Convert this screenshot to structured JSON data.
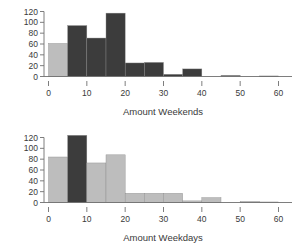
{
  "figure": {
    "background": "#ffffff",
    "axis_color": "#6f6f6f",
    "text_color": "#3a3a3a",
    "dark_bar_color": "#3c3c3c",
    "light_bar_color": "#bdbdbd"
  },
  "chart_data": [
    {
      "type": "bar",
      "title": "",
      "xlabel": "Amount Weekends",
      "ylabel": "",
      "xlim": [
        0,
        62
      ],
      "ylim": [
        0,
        125
      ],
      "xticks": [
        0,
        10,
        20,
        30,
        40,
        50,
        60
      ],
      "xticklabels": [
        "0",
        "10",
        "20",
        "30",
        "40",
        "50",
        "60"
      ],
      "yticks": [
        0,
        20,
        40,
        60,
        80,
        100,
        120
      ],
      "yticklabels": [
        "0",
        "20",
        "40",
        "60",
        "80",
        "100",
        "120"
      ],
      "grid": false,
      "legend": "none",
      "bin_width": 5,
      "bin_edges": [
        0,
        5,
        10,
        15,
        20,
        25,
        30,
        35,
        40,
        45,
        50,
        55,
        60
      ],
      "categories": [
        "0-5",
        "5-10",
        "10-15",
        "15-20",
        "20-25",
        "25-30",
        "30-35",
        "35-40",
        "40-45",
        "45-50",
        "50-55",
        "55-60"
      ],
      "values": [
        61,
        94,
        71,
        117,
        25,
        26,
        4,
        14,
        0,
        2,
        0,
        1
      ],
      "bar_colors": [
        "#bdbdbd",
        "#3c3c3c",
        "#3c3c3c",
        "#3c3c3c",
        "#3c3c3c",
        "#3c3c3c",
        "#3c3c3c",
        "#3c3c3c",
        "#3c3c3c",
        "#3c3c3c",
        "#3c3c3c",
        "#3c3c3c"
      ]
    },
    {
      "type": "bar",
      "title": "",
      "xlabel": "Amount Weekdays",
      "ylabel": "",
      "xlim": [
        0,
        62
      ],
      "ylim": [
        0,
        125
      ],
      "xticks": [
        0,
        10,
        20,
        30,
        40,
        50,
        60
      ],
      "xticklabels": [
        "0",
        "10",
        "20",
        "30",
        "40",
        "50",
        "60"
      ],
      "yticks": [
        0,
        20,
        40,
        60,
        80,
        100,
        120
      ],
      "yticklabels": [
        "0",
        "20",
        "40",
        "60",
        "80",
        "100",
        "120"
      ],
      "grid": false,
      "legend": "none",
      "bin_width": 5,
      "bin_edges": [
        0,
        5,
        10,
        15,
        20,
        25,
        30,
        35,
        40,
        45,
        50,
        55,
        60
      ],
      "categories": [
        "0-5",
        "5-10",
        "10-15",
        "15-20",
        "20-25",
        "25-30",
        "30-35",
        "35-40",
        "40-45",
        "45-50",
        "50-55",
        "55-60"
      ],
      "values": [
        84,
        124,
        73,
        88,
        17,
        17,
        17,
        3,
        9,
        0,
        2,
        1
      ],
      "bar_colors": [
        "#bdbdbd",
        "#3c3c3c",
        "#bdbdbd",
        "#bdbdbd",
        "#bdbdbd",
        "#bdbdbd",
        "#bdbdbd",
        "#bdbdbd",
        "#bdbdbd",
        "#bdbdbd",
        "#bdbdbd",
        "#bdbdbd"
      ]
    }
  ]
}
